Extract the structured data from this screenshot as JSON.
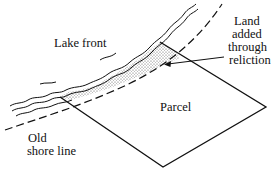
{
  "diagram": {
    "labels": {
      "lake_front": "Lake front",
      "land_added_line1": "Land",
      "land_added_line2": "added",
      "land_added_line3": "through",
      "land_added_line4": "reliction",
      "parcel": "Parcel",
      "old_shore_line1": "Old",
      "old_shore_line2": "shore line"
    },
    "colors": {
      "ink": "#111111",
      "stipple": "#9a9a9a",
      "background": "#ffffff"
    }
  }
}
